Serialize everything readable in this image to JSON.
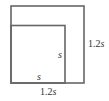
{
  "diagram": {
    "outer_square": {
      "side_label": "1.2s",
      "bottom_label": "1.2s"
    },
    "inner_square": {
      "side_label": "s",
      "bottom_label": "s"
    },
    "stroke_color": "#666666"
  },
  "labels": {
    "outer_right_num": "1.2",
    "outer_right_var": "s",
    "outer_bottom_num": "1.2",
    "outer_bottom_var": "s",
    "inner_right_var": "s",
    "inner_bottom_var": "s"
  }
}
